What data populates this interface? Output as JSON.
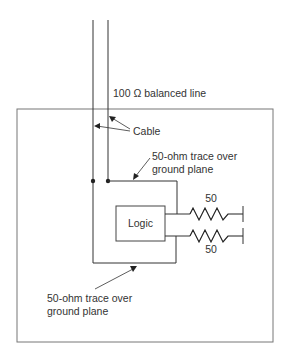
{
  "diagram": {
    "labels": {
      "balanced_line": "100 Ω balanced line",
      "cable": "Cable",
      "trace_top_line1": "50-ohm trace over",
      "trace_top_line2": "ground plane",
      "logic": "Logic",
      "resistor_top": "50",
      "resistor_bottom": "50",
      "trace_bottom_line1": "50-ohm trace over",
      "trace_bottom_line2": "ground plane"
    },
    "colors": {
      "line": "#333333",
      "box": "#666666",
      "background": "#ffffff"
    }
  }
}
